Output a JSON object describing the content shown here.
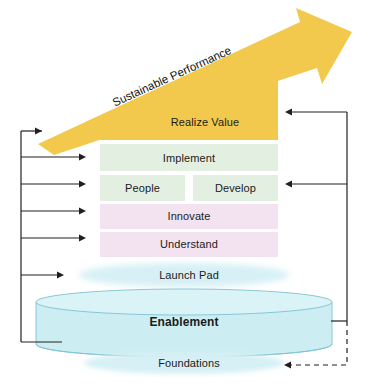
{
  "diagram": {
    "arrow": {
      "label": "Sustainable Performance",
      "color": "#f2c94c",
      "direction": "up-right"
    },
    "layers": [
      {
        "id": "realize-value",
        "label": "Realize Value",
        "color": "#f2c94c",
        "shape": "wedge"
      },
      {
        "id": "implement",
        "label": "Implement",
        "color": "#e3efe0",
        "shape": "bar"
      },
      {
        "id": "people",
        "label": "People",
        "color": "#e3efe0",
        "shape": "bar-half-left"
      },
      {
        "id": "develop",
        "label": "Develop",
        "color": "#e3efe0",
        "shape": "bar-half-right"
      },
      {
        "id": "innovate",
        "label": "Innovate",
        "color": "#f3e2f0",
        "shape": "bar"
      },
      {
        "id": "understand",
        "label": "Understand",
        "color": "#f3e2f0",
        "shape": "bar"
      },
      {
        "id": "launch-pad",
        "label": "Launch Pad",
        "color": "#d6f0f5",
        "shape": "ellipse"
      },
      {
        "id": "enablement",
        "label": "Enablement",
        "color": "#cceef2",
        "shape": "cylinder",
        "emphasis": "bold"
      },
      {
        "id": "foundations",
        "label": "Foundations",
        "color": "#d6f0f5",
        "shape": "ellipse"
      }
    ],
    "connectors": {
      "left_spine": {
        "style": "solid",
        "color": "#231f20",
        "targets": [
          "realize-value",
          "implement",
          "people",
          "innovate",
          "understand",
          "launch-pad"
        ],
        "source": "enablement"
      },
      "right_spine": {
        "style": "solid",
        "color": "#231f20",
        "targets": [
          "realize-value",
          "develop"
        ],
        "source": "enablement"
      },
      "foundations_feedback": {
        "style": "dashed",
        "color": "#231f20",
        "target": "foundations"
      }
    }
  }
}
